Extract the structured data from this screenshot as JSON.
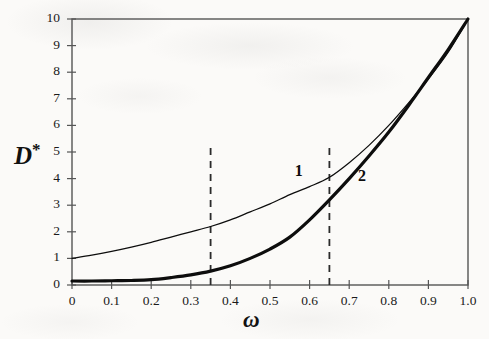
{
  "figure": {
    "background_color": "#fbfaf8",
    "frame_color": "#555555",
    "curve_color": "#0d0d0d"
  },
  "axis_titles": {
    "y": "D",
    "y_superscript": "*",
    "x": "ω"
  },
  "curve_labels": {
    "one": "1",
    "two": "2"
  },
  "chart_data": {
    "type": "line",
    "title": "",
    "xlabel": "ω",
    "ylabel": "D*",
    "xlim": [
      0,
      1.0
    ],
    "ylim": [
      0,
      10
    ],
    "grid": false,
    "legend": "inline-curve-labels",
    "xticks": [
      0,
      0.1,
      0.2,
      0.3,
      0.4,
      0.5,
      0.6,
      0.7,
      0.8,
      0.9,
      1.0
    ],
    "xtick_labels": [
      "0",
      "0.1",
      "0.2",
      "0.3",
      "0.4",
      "0.5",
      "0.6",
      "0.7",
      "0.8",
      "0.9",
      "1.0"
    ],
    "yticks": [
      0,
      1,
      2,
      3,
      4,
      5,
      6,
      7,
      8,
      9,
      10
    ],
    "ytick_labels": [
      "0",
      "1",
      "2",
      "3",
      "4",
      "5",
      "6",
      "7",
      "8",
      "9",
      "10"
    ],
    "series": [
      {
        "name": "1",
        "label": "1",
        "style": "thin-solid",
        "x": [
          0.0,
          0.05,
          0.1,
          0.15,
          0.2,
          0.25,
          0.3,
          0.35,
          0.4,
          0.45,
          0.5,
          0.55,
          0.6,
          0.65,
          0.7,
          0.75,
          0.8,
          0.85,
          0.9,
          0.95,
          1.0
        ],
        "y": [
          1.0,
          1.12,
          1.26,
          1.42,
          1.6,
          1.8,
          2.0,
          2.2,
          2.45,
          2.75,
          3.05,
          3.4,
          3.7,
          4.05,
          4.6,
          5.25,
          6.0,
          6.85,
          7.75,
          8.75,
          10.0
        ]
      },
      {
        "name": "2",
        "label": "2",
        "style": "thick-solid",
        "x": [
          0.0,
          0.05,
          0.1,
          0.15,
          0.2,
          0.25,
          0.3,
          0.35,
          0.4,
          0.45,
          0.5,
          0.55,
          0.6,
          0.65,
          0.7,
          0.75,
          0.8,
          0.85,
          0.9,
          0.95,
          1.0
        ],
        "y": [
          0.15,
          0.15,
          0.16,
          0.17,
          0.2,
          0.28,
          0.38,
          0.52,
          0.72,
          1.0,
          1.35,
          1.8,
          2.45,
          3.2,
          4.0,
          4.85,
          5.75,
          6.75,
          7.8,
          8.85,
          10.0
        ]
      }
    ],
    "annotations": [
      {
        "type": "vertical-dashed-line",
        "x": 0.35,
        "y_from": 0,
        "y_to": 5.25
      },
      {
        "type": "vertical-dashed-line",
        "x": 0.65,
        "y_from": 0,
        "y_to": 5.25
      }
    ]
  }
}
